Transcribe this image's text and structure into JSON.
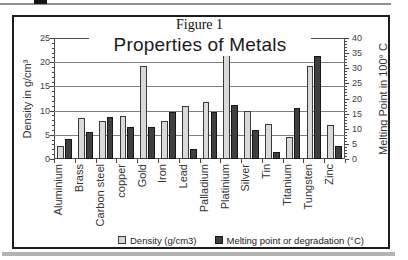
{
  "page": {
    "figure_caption": "Figure 1"
  },
  "chart_data": {
    "type": "bar",
    "title": "Properties of Metals",
    "categories": [
      "Aluminium",
      "Brass",
      "Carbon steel",
      "copper",
      "Gold",
      "Iron",
      "Lead",
      "Palladium",
      "Platinium",
      "Silver",
      "Tin",
      "Titanium",
      "Tungsten",
      "Zinc"
    ],
    "series": [
      {
        "name": "Density (g/cm3)",
        "axis": "left",
        "color": "#d9d9d9",
        "border_color": "#3a3a3a",
        "values": [
          2.7,
          8.5,
          7.8,
          8.9,
          19.3,
          7.9,
          11.0,
          11.7,
          21.4,
          10.0,
          7.3,
          4.5,
          19.2,
          7.0
        ]
      },
      {
        "name": "Melting point or degradation (°C)",
        "axis": "right",
        "color": "#3f3f3f",
        "border_color": "#161616",
        "values": [
          6.6,
          9.0,
          13.8,
          10.5,
          10.6,
          15.4,
          3.3,
          15.5,
          17.7,
          9.6,
          2.3,
          16.7,
          34.2,
          4.2
        ]
      }
    ],
    "left_axis": {
      "label": "Density in g/cm³",
      "min": 0,
      "max": 25,
      "ticks": [
        "0",
        "5",
        "10",
        "15",
        "20",
        "25"
      ]
    },
    "right_axis": {
      "label": "Melting Point in 100° C",
      "min": 0,
      "max": 40,
      "ticks": [
        "0",
        "5",
        "10",
        "15",
        "20",
        "25",
        "30",
        "35",
        "40"
      ]
    },
    "grid": true,
    "gridline_color": "#7f7f7f",
    "legend_position": "bottom"
  }
}
